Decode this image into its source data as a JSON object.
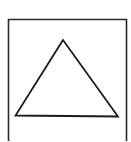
{
  "diagram": {
    "type": "geometric-figure",
    "shapes": [
      {
        "kind": "open-box",
        "description": "rectangle frame without bottom edge"
      },
      {
        "kind": "triangle",
        "description": "outlined triangle inside frame"
      }
    ],
    "colors": {
      "stroke": "#1a1a1a",
      "background": "#ffffff"
    }
  }
}
